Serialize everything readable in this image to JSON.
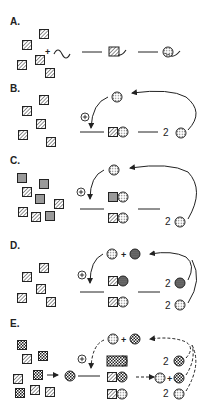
{
  "panels": [
    {
      "label": "A.",
      "description": "Monomers + template strand form a complex that folds into a circular structure"
    },
    {
      "label": "B.",
      "description": "Autocatalytic replication: product catalyzes its own formation, yielding 2 copies"
    },
    {
      "label": "C.",
      "description": "Two monomer types; product templates both complexes"
    },
    {
      "label": "D.",
      "description": "Cross-catalysis with two product species, each yielding 2"
    },
    {
      "label": "E.",
      "description": "Activated intermediate, three complexes, mixed products with dashed feedback"
    }
  ],
  "symbols": {
    "plus": "+",
    "catalyst_mark": "+",
    "stoichiometry": "2"
  },
  "colors": {
    "ink": "#222222",
    "fill_grey": "#9a9a9a",
    "background": "#ffffff"
  }
}
